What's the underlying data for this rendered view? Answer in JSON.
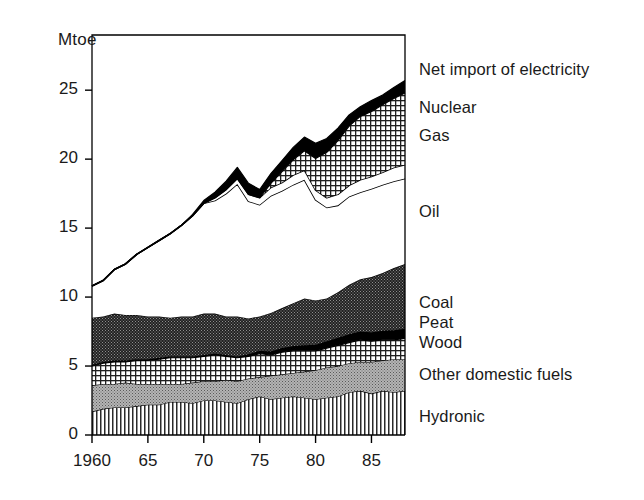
{
  "chart_data": {
    "type": "area",
    "title": "",
    "subtitle": "",
    "xlabel": "",
    "ylabel": "Mtoe",
    "ylim": [
      0,
      29
    ],
    "xlim": [
      1960,
      1988
    ],
    "grid": false,
    "stacked": true,
    "legend_position": "right-inline",
    "yticks": [
      0,
      5,
      10,
      15,
      20,
      25
    ],
    "ytick_labels": [
      "0",
      "5",
      "10",
      "15",
      "20",
      "25"
    ],
    "xticks": [
      1960,
      1965,
      1970,
      1975,
      1980,
      1985
    ],
    "xtick_labels": [
      "1960",
      "65",
      "70",
      "75",
      "80",
      "85"
    ],
    "x": [
      1960,
      1961,
      1962,
      1963,
      1964,
      1965,
      1966,
      1967,
      1968,
      1969,
      1970,
      1971,
      1972,
      1973,
      1974,
      1975,
      1976,
      1977,
      1978,
      1979,
      1980,
      1981,
      1982,
      1983,
      1984,
      1985,
      1986,
      1987,
      1988
    ],
    "series": [
      {
        "name": "Hydronic",
        "pattern": "vertical-lines",
        "values": [
          1.7,
          1.9,
          2.0,
          2.0,
          2.1,
          2.2,
          2.2,
          2.4,
          2.4,
          2.3,
          2.5,
          2.5,
          2.4,
          2.3,
          2.6,
          2.8,
          2.6,
          2.7,
          2.8,
          2.7,
          2.6,
          2.7,
          2.8,
          3.1,
          3.2,
          3.0,
          3.2,
          3.1,
          3.2
        ]
      },
      {
        "name": "Other domestic fuels",
        "pattern": "gray-stipple",
        "values": [
          1.9,
          1.8,
          1.7,
          1.8,
          1.6,
          1.5,
          1.5,
          1.3,
          1.3,
          1.5,
          1.4,
          1.4,
          1.6,
          1.6,
          1.5,
          1.4,
          1.7,
          1.7,
          1.7,
          1.9,
          2.1,
          2.2,
          2.2,
          2.1,
          2.1,
          2.3,
          2.2,
          2.4,
          2.3
        ]
      },
      {
        "name": "Wood",
        "pattern": "fine-grid",
        "values": [
          1.4,
          1.5,
          1.6,
          1.5,
          1.7,
          1.7,
          1.8,
          1.9,
          1.9,
          1.8,
          1.8,
          1.9,
          1.7,
          1.7,
          1.6,
          1.7,
          1.5,
          1.6,
          1.6,
          1.5,
          1.4,
          1.4,
          1.5,
          1.5,
          1.6,
          1.5,
          1.5,
          1.4,
          1.5
        ]
      },
      {
        "name": "Peat",
        "pattern": "solid-black",
        "values": [
          0.1,
          0.1,
          0.1,
          0.1,
          0.1,
          0.1,
          0.1,
          0.1,
          0.1,
          0.1,
          0.1,
          0.1,
          0.1,
          0.1,
          0.15,
          0.2,
          0.25,
          0.3,
          0.35,
          0.4,
          0.45,
          0.5,
          0.55,
          0.6,
          0.6,
          0.65,
          0.65,
          0.7,
          0.7
        ]
      },
      {
        "name": "Coal",
        "pattern": "dark-checker",
        "values": [
          3.4,
          3.3,
          3.4,
          3.3,
          3.2,
          3.1,
          3.0,
          2.8,
          2.9,
          2.9,
          3.0,
          2.9,
          2.8,
          2.9,
          2.6,
          2.5,
          2.8,
          2.9,
          3.1,
          3.4,
          3.2,
          3.1,
          3.3,
          3.6,
          3.8,
          4.0,
          4.2,
          4.5,
          4.7
        ]
      },
      {
        "name": "Oil",
        "pattern": "white",
        "values": [
          2.3,
          2.6,
          3.2,
          3.7,
          4.4,
          5.0,
          5.5,
          6.1,
          6.6,
          7.3,
          8.0,
          8.2,
          8.9,
          9.6,
          8.5,
          8.1,
          8.5,
          8.5,
          8.6,
          8.6,
          7.3,
          6.6,
          6.3,
          6.4,
          6.3,
          6.4,
          6.4,
          6.3,
          6.2
        ]
      },
      {
        "name": "Gas",
        "pattern": "white-band",
        "values": [
          0.0,
          0.0,
          0.0,
          0.0,
          0.0,
          0.0,
          0.0,
          0.0,
          0.0,
          0.0,
          0.0,
          0.2,
          0.3,
          0.4,
          0.5,
          0.5,
          0.6,
          0.6,
          0.7,
          0.7,
          0.7,
          0.7,
          0.8,
          0.8,
          0.9,
          0.9,
          0.9,
          1.0,
          1.0
        ]
      },
      {
        "name": "Nuclear",
        "pattern": "fine-grid",
        "values": [
          0.0,
          0.0,
          0.0,
          0.0,
          0.0,
          0.0,
          0.0,
          0.0,
          0.0,
          0.0,
          0.0,
          0.0,
          0.0,
          0.0,
          0.0,
          0.0,
          0.3,
          0.8,
          1.1,
          1.4,
          2.3,
          3.3,
          3.9,
          4.3,
          4.6,
          4.7,
          4.9,
          5.0,
          5.2
        ]
      },
      {
        "name": "Net import of electricity",
        "pattern": "solid-black",
        "values": [
          0.0,
          0.0,
          0.0,
          0.0,
          0.0,
          0.0,
          0.0,
          0.0,
          0.0,
          0.1,
          0.2,
          0.4,
          0.6,
          0.8,
          0.8,
          0.6,
          0.7,
          0.8,
          0.9,
          1.0,
          1.1,
          1.0,
          0.9,
          0.8,
          0.7,
          0.8,
          0.7,
          0.8,
          0.9
        ]
      }
    ],
    "totals_note": ""
  },
  "legend": {
    "items": [
      {
        "label": "Net import of electricity",
        "y": 70
      },
      {
        "label": "Nuclear",
        "y": 108
      },
      {
        "label": "Gas",
        "y": 136
      },
      {
        "label": "Oil",
        "y": 212
      },
      {
        "label": "Coal",
        "y": 303
      },
      {
        "label": "Peat",
        "y": 323
      },
      {
        "label": "Wood",
        "y": 343
      },
      {
        "label": "Other domestic fuels",
        "y": 375
      },
      {
        "label": "Hydronic",
        "y": 417
      }
    ]
  },
  "axes": {
    "unit_label": "Mtoe"
  }
}
